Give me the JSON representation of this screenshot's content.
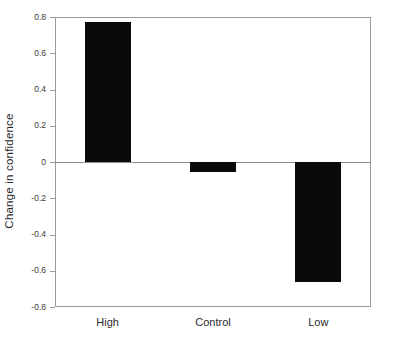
{
  "chart_data": {
    "type": "bar",
    "title": "",
    "xlabel": "",
    "ylabel": "Change in confidence",
    "categories": [
      "High",
      "Control",
      "Low"
    ],
    "values": [
      0.77,
      -0.055,
      -0.66
    ],
    "ylim": [
      -0.8,
      0.8
    ],
    "yticks": [
      0.8,
      0.6,
      0.4,
      0.2,
      0,
      -0.2,
      -0.4,
      -0.6,
      -0.8
    ],
    "ytick_labels": [
      "0.8",
      "0.6",
      "0.4",
      "0.2",
      "0",
      "-0.2",
      "-0.4",
      "-0.6",
      "-0.8"
    ],
    "grid": false,
    "legend": null,
    "bar_color": "#0a0a0a",
    "axis_color": "#9a9a9a",
    "zero_line": 0
  }
}
